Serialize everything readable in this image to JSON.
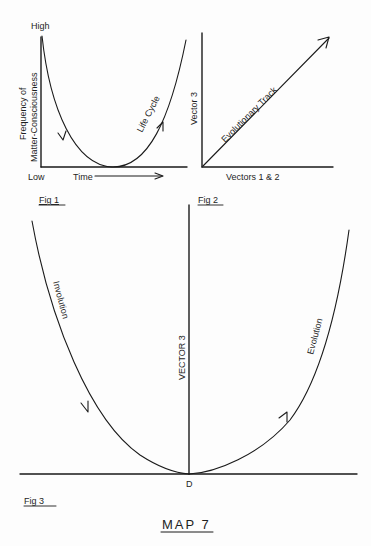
{
  "fig1": {
    "caption": "Fig 1",
    "y_axis_title_line1": "Frequency of",
    "y_axis_title_line2": "Matter-Consciousness",
    "y_high_label": "High",
    "y_low_label": "Low",
    "x_axis_label": "Time",
    "curve_label": "Life Cycle"
  },
  "fig2": {
    "caption": "Fig 2",
    "y_axis_label": "Vector 3",
    "x_axis_label": "Vectors 1 & 2",
    "track_label": "Evolutionary Track"
  },
  "fig3": {
    "caption": "Fig 3",
    "vertical_axis_label": "VECTOR 3",
    "left_curve_label": "Involution",
    "right_curve_label": "Evolution",
    "origin_label": "D"
  },
  "title": "MAP 7",
  "colors": {
    "ink": "#1a1a1a",
    "paper": "#fdfdfd"
  }
}
